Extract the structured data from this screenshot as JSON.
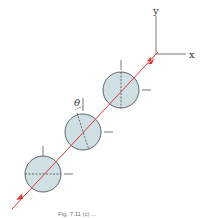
{
  "axes": {
    "y_label": "y",
    "x_label": "x"
  },
  "angle_label": "θ",
  "colors": {
    "beam": "#d93a3a",
    "disk_fill": "#cfe0e4",
    "disk_stroke": "#444444",
    "axis": "#555555"
  },
  "disks": [
    {
      "id": "top",
      "axis_angle_deg": 0
    },
    {
      "id": "middle",
      "axis_angle_deg": -20,
      "angle_marked": true
    },
    {
      "id": "bottom",
      "axis_angle_deg": 90
    }
  ],
  "caption": "Fig. 7.11 (c) ..."
}
